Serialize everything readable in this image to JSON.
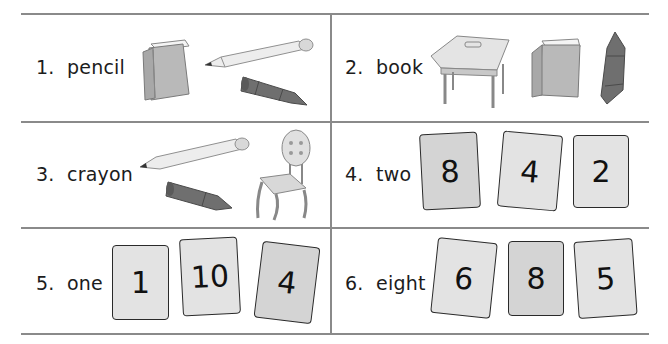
{
  "worksheet": {
    "items": [
      {
        "number": "1.",
        "word": "pencil",
        "label": "1.  pencil",
        "pictures": [
          "book",
          "pencil",
          "crayon"
        ]
      },
      {
        "number": "2.",
        "word": "book",
        "label": "2.  book",
        "pictures": [
          "desk",
          "book",
          "crayon"
        ]
      },
      {
        "number": "3.",
        "word": "crayon",
        "label": "3.  crayon",
        "pictures": [
          "pencil",
          "crayon",
          "chair"
        ]
      },
      {
        "number": "4.",
        "word": "two",
        "label": "4.  two",
        "cards": [
          "8",
          "4",
          "2"
        ]
      },
      {
        "number": "5.",
        "word": "one",
        "label": "5.  one",
        "cards": [
          "1",
          "10",
          "4"
        ]
      },
      {
        "number": "6.",
        "word": "eight",
        "label": "6.  eight",
        "cards": [
          "6",
          "8",
          "5"
        ]
      }
    ]
  },
  "colors": {
    "rule_line": "#8a8a8a",
    "card_fill": "#e3e3e3",
    "card_fill_dark": "#d4d4d4",
    "card_border": "#2a2a2a"
  }
}
